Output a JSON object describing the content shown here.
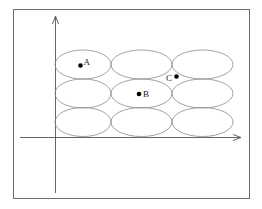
{
  "diagram": {
    "type": "ellipse-grid-on-axes",
    "colors": {
      "frame": "#6e6e6e",
      "axes": "#555555",
      "ellipses": "#8a8a8a",
      "points": "#000000"
    },
    "grid": {
      "rows": 3,
      "columns": 3
    },
    "points": [
      {
        "label": "A",
        "row": 1,
        "column": 1
      },
      {
        "label": "B",
        "row": 2,
        "column": 2
      },
      {
        "label": "C",
        "between": "row 1-2, column 2-3"
      }
    ]
  },
  "labels": {
    "A": "A",
    "B": "B",
    "C": "C"
  }
}
